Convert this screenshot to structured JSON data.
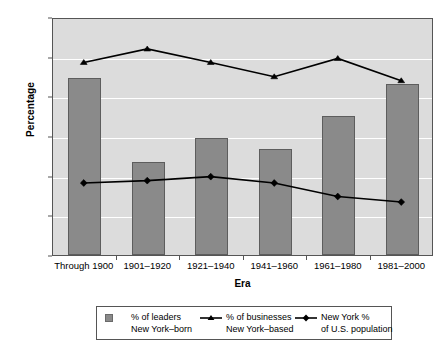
{
  "chart_data": {
    "type": "bar",
    "title": "",
    "xlabel": "Era",
    "ylabel": "Percentage",
    "ylim": [
      0,
      30
    ],
    "yticks": [
      0,
      5,
      10,
      15,
      20,
      25,
      30
    ],
    "grid": true,
    "legend_position": "bottom",
    "categories": [
      "Through 1900",
      "1901–1920",
      "1921–1940",
      "1941–1960",
      "1961–1980",
      "1981–2000"
    ],
    "series": [
      {
        "name": "% of leaders New York–born",
        "type": "bar",
        "marker": "square",
        "color": "#8a8a8a",
        "values": [
          22.3,
          11.7,
          14.8,
          13.4,
          17.5,
          21.5
        ]
      },
      {
        "name": "% of businesses New York–based",
        "type": "line",
        "marker": "triangle",
        "color": "#000000",
        "values": [
          24.4,
          26.1,
          24.4,
          22.6,
          24.9,
          22.1
        ]
      },
      {
        "name": "New York % of U.S. population",
        "type": "line",
        "marker": "diamond",
        "color": "#000000",
        "values": [
          9.2,
          9.5,
          10.0,
          9.2,
          7.5,
          6.8
        ]
      }
    ]
  },
  "axes": {
    "y_title": "Percentage",
    "x_title": "Era",
    "y_tick_labels": [
      "0",
      "5",
      "10",
      "15",
      "20",
      "25",
      "30"
    ],
    "x_tick_labels": [
      "Through 1900",
      "1901–1920",
      "1921–1940",
      "1941–1960",
      "1961–1980",
      "1981–2000"
    ]
  },
  "legend": {
    "entries": [
      {
        "marker": "square-swatch",
        "line1": "% of leaders",
        "line2": "New York–born"
      },
      {
        "marker": "triangle-line",
        "line1": "% of businesses",
        "line2": "New York–based"
      },
      {
        "marker": "diamond-line",
        "line1": "New York %",
        "line2": "of U.S. population"
      }
    ]
  },
  "colors": {
    "bar_fill": "#8a8a8a",
    "bar_edge": "#5d5d5d",
    "plot_background": "#dcdcdc",
    "gridline": "#ffffff",
    "line": "#000000",
    "frame": "#555555"
  }
}
